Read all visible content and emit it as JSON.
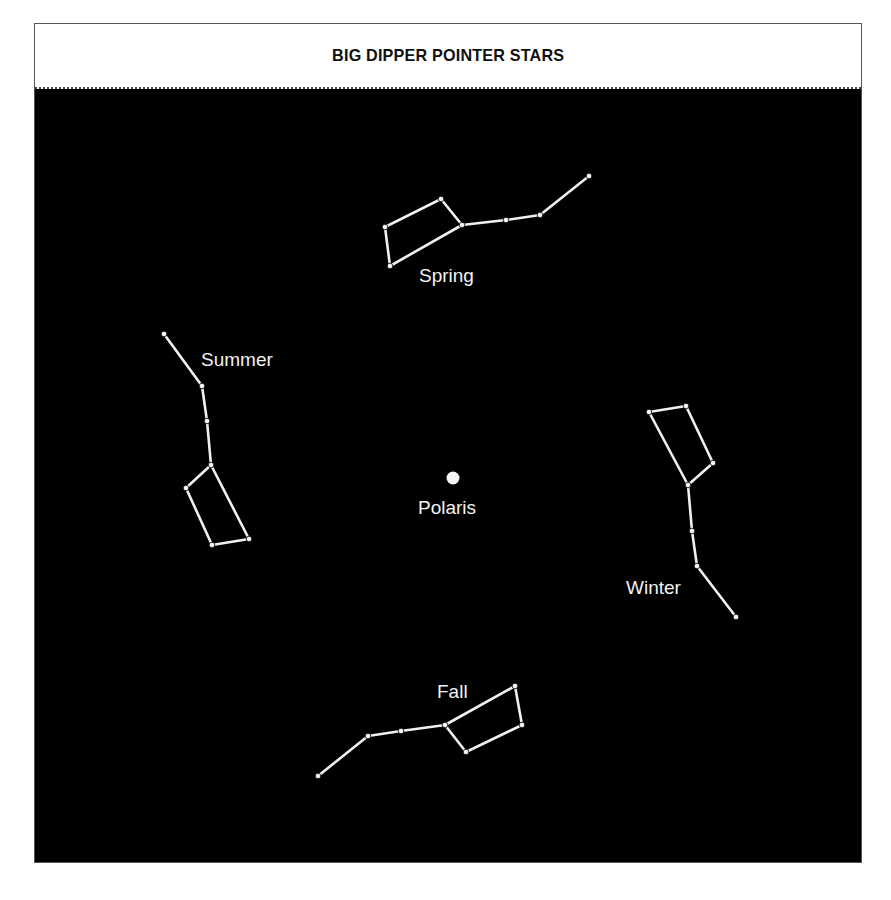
{
  "title": "BIG DIPPER POINTER STARS",
  "colors": {
    "sky": "#000000",
    "star": "#f5f5f5",
    "line": "#f0f0f0",
    "header_bg": "#ffffff",
    "title_text": "#111111"
  },
  "center_star": {
    "name": "Polaris",
    "label": "Polaris",
    "x": 453,
    "y": 478,
    "r": 6.5,
    "label_x": 418,
    "label_y": 498
  },
  "constellations": [
    {
      "id": "spring",
      "label": "Spring",
      "label_x": 419,
      "label_y": 266,
      "stars": [
        [
          390,
          266
        ],
        [
          385,
          227
        ],
        [
          441,
          199
        ],
        [
          462,
          225
        ],
        [
          506,
          220
        ],
        [
          540,
          215
        ],
        [
          589,
          176
        ]
      ],
      "edges": [
        [
          0,
          1
        ],
        [
          1,
          2
        ],
        [
          2,
          3
        ],
        [
          3,
          0
        ],
        [
          3,
          4
        ],
        [
          4,
          5
        ],
        [
          5,
          6
        ]
      ]
    },
    {
      "id": "summer",
      "label": "Summer",
      "label_x": 201,
      "label_y": 350,
      "stars": [
        [
          164,
          334
        ],
        [
          202,
          386
        ],
        [
          207,
          421
        ],
        [
          211,
          465
        ],
        [
          186,
          488
        ],
        [
          212,
          545
        ],
        [
          249,
          539
        ]
      ],
      "edges": [
        [
          0,
          1
        ],
        [
          1,
          2
        ],
        [
          2,
          3
        ],
        [
          3,
          4
        ],
        [
          4,
          5
        ],
        [
          5,
          6
        ],
        [
          6,
          3
        ]
      ]
    },
    {
      "id": "winter",
      "label": "Winter",
      "label_x": 626,
      "label_y": 578,
      "stars": [
        [
          649,
          412
        ],
        [
          686,
          406
        ],
        [
          713,
          463
        ],
        [
          688,
          485
        ],
        [
          692,
          531
        ],
        [
          697,
          566
        ],
        [
          736,
          617
        ]
      ],
      "edges": [
        [
          0,
          1
        ],
        [
          1,
          2
        ],
        [
          2,
          3
        ],
        [
          3,
          0
        ],
        [
          3,
          4
        ],
        [
          4,
          5
        ],
        [
          5,
          6
        ]
      ]
    },
    {
      "id": "fall",
      "label": "Fall",
      "label_x": 437,
      "label_y": 682,
      "stars": [
        [
          318,
          776
        ],
        [
          368,
          736
        ],
        [
          401,
          731
        ],
        [
          445,
          725
        ],
        [
          515,
          686
        ],
        [
          522,
          725
        ],
        [
          466,
          752
        ]
      ],
      "edges": [
        [
          0,
          1
        ],
        [
          1,
          2
        ],
        [
          2,
          3
        ],
        [
          3,
          4
        ],
        [
          4,
          5
        ],
        [
          5,
          6
        ],
        [
          6,
          3
        ]
      ]
    }
  ]
}
